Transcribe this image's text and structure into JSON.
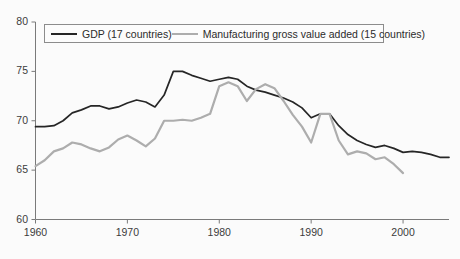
{
  "chart_data": {
    "type": "line",
    "title": "",
    "subtitle": "",
    "xlabel": "",
    "ylabel": "",
    "xlim": [
      1960,
      2005
    ],
    "ylim": [
      60,
      80
    ],
    "grid": false,
    "legend_position": "top-left",
    "xticks": [
      "1960",
      "1970",
      "1980",
      "1990",
      "2000"
    ],
    "xtick_values": [
      1960,
      1970,
      1980,
      1990,
      2000
    ],
    "yticks": [
      "60",
      "65",
      "70",
      "75",
      "80"
    ],
    "ytick_values": [
      60,
      65,
      70,
      75,
      80
    ],
    "series": [
      {
        "name": "GDP (17 countries)",
        "color": "#262626",
        "x": [
          1960,
          1961,
          1962,
          1963,
          1964,
          1965,
          1966,
          1967,
          1968,
          1969,
          1970,
          1971,
          1972,
          1973,
          1974,
          1975,
          1976,
          1977,
          1978,
          1979,
          1980,
          1981,
          1982,
          1983,
          1984,
          1985,
          1986,
          1987,
          1988,
          1989,
          1990,
          1991,
          1992,
          1993,
          1994,
          1995,
          1996,
          1997,
          1998,
          1999,
          2000,
          2001,
          2002,
          2003,
          2004,
          2005
        ],
        "values": [
          69.4,
          69.4,
          69.5,
          70.0,
          70.8,
          71.1,
          71.5,
          71.5,
          71.2,
          71.4,
          71.8,
          72.1,
          71.9,
          71.4,
          72.6,
          75.0,
          75.0,
          74.6,
          74.3,
          74.0,
          74.2,
          74.4,
          74.2,
          73.5,
          73.1,
          72.9,
          72.6,
          72.3,
          71.9,
          71.3,
          70.3,
          70.7,
          70.7,
          69.5,
          68.6,
          68.0,
          67.6,
          67.3,
          67.5,
          67.2,
          66.8,
          66.9,
          66.8,
          66.6,
          66.3,
          66.3
        ]
      },
      {
        "name": "Manufacturing gross value added (15 countries)",
        "color": "#adadad",
        "x": [
          1960,
          1961,
          1962,
          1963,
          1964,
          1965,
          1966,
          1967,
          1968,
          1969,
          1970,
          1971,
          1972,
          1973,
          1974,
          1975,
          1976,
          1977,
          1978,
          1979,
          1980,
          1981,
          1982,
          1983,
          1984,
          1985,
          1986,
          1987,
          1988,
          1989,
          1990,
          1991,
          1992,
          1993,
          1994,
          1995,
          1996,
          1997,
          1998,
          1999,
          2000
        ],
        "values": [
          65.4,
          66.0,
          66.9,
          67.2,
          67.8,
          67.6,
          67.2,
          66.9,
          67.3,
          68.1,
          68.5,
          68.0,
          67.4,
          68.2,
          70.0,
          70.0,
          70.1,
          70.0,
          70.3,
          70.7,
          73.5,
          73.9,
          73.5,
          72.0,
          73.2,
          73.7,
          73.3,
          72.0,
          70.6,
          69.4,
          67.8,
          70.7,
          70.7,
          68.0,
          66.6,
          66.9,
          66.7,
          66.1,
          66.3,
          65.6,
          64.7
        ]
      }
    ]
  },
  "legend": {
    "entries": [
      {
        "label": "GDP (17 countries)",
        "style": "dark"
      },
      {
        "label": "Manufacturing gross value added (15 countries)",
        "style": "gray"
      }
    ]
  },
  "axes": {
    "y_labels": [
      "80",
      "75",
      "70",
      "65",
      "60"
    ],
    "x_labels": [
      "1960",
      "1970",
      "1980",
      "1990",
      "2000"
    ],
    "axis_color": "#7a7a7a"
  }
}
